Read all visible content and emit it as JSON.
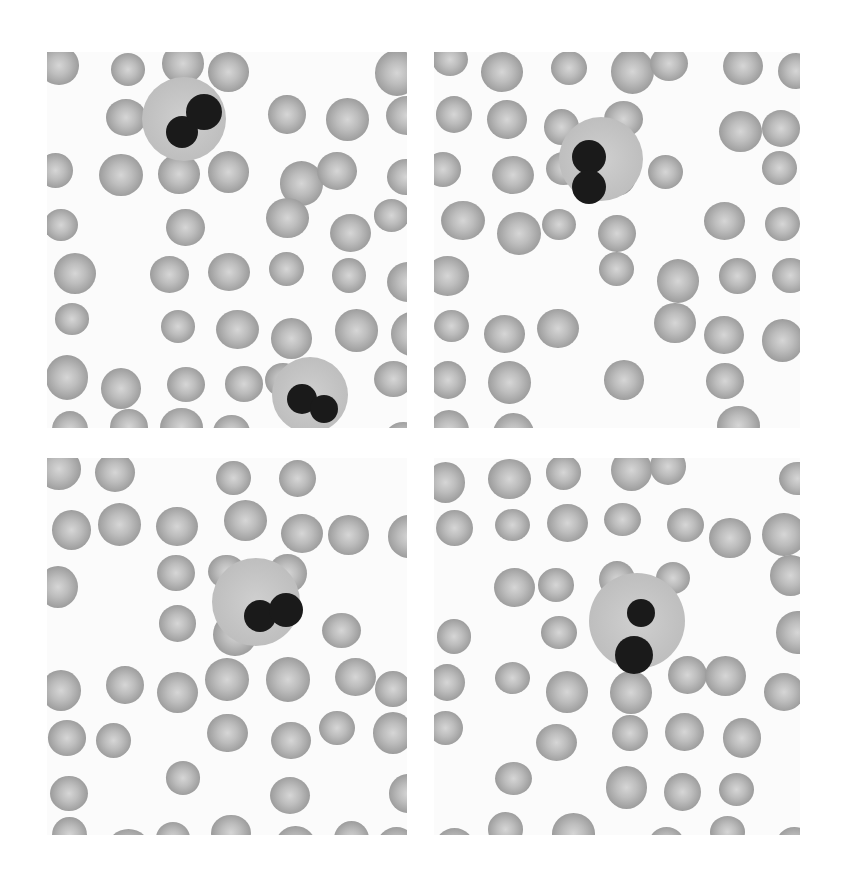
{
  "figure": {
    "panels": [
      {
        "id": "top-left",
        "x": 47,
        "y": 52,
        "w": 360,
        "h": 376,
        "wbcs": [
          {
            "x": 95,
            "y": 25,
            "r": 42,
            "nuclei": [
              [
                40,
                55,
                16
              ],
              [
                62,
                35,
                18
              ]
            ]
          },
          {
            "x": 225,
            "y": 305,
            "r": 38,
            "nuclei": [
              [
                30,
                42,
                15
              ],
              [
                52,
                52,
                14
              ]
            ]
          }
        ]
      },
      {
        "id": "top-right",
        "x": 434,
        "y": 52,
        "w": 366,
        "h": 376,
        "wbcs": [
          {
            "x": 125,
            "y": 65,
            "r": 42,
            "nuclei": [
              [
                30,
                40,
                17
              ],
              [
                30,
                70,
                17
              ]
            ]
          }
        ]
      },
      {
        "id": "bottom-left",
        "x": 47,
        "y": 458,
        "w": 360,
        "h": 377,
        "wbcs": [
          {
            "x": 165,
            "y": 100,
            "r": 44,
            "nuclei": [
              [
                48,
                58,
                16
              ],
              [
                74,
                52,
                17
              ]
            ]
          }
        ]
      },
      {
        "id": "bottom-right",
        "x": 434,
        "y": 458,
        "w": 366,
        "h": 377,
        "wbcs": [
          {
            "x": 155,
            "y": 115,
            "r": 48,
            "nuclei": [
              [
                52,
                40,
                14
              ],
              [
                45,
                82,
                19
              ]
            ]
          }
        ]
      }
    ]
  }
}
